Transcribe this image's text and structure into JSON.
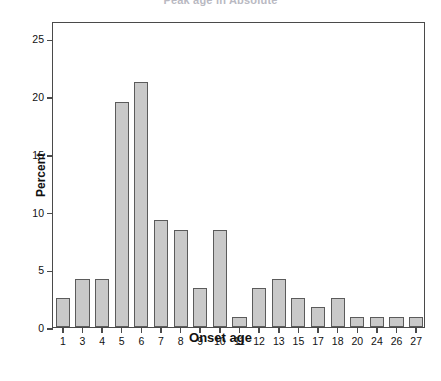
{
  "title_clipped": "Peak age in Absolute",
  "axes": {
    "xlabel": "Onset age",
    "ylabel": "Percent",
    "yticks": [
      0,
      5,
      10,
      15,
      20,
      25
    ],
    "ylim": [
      0,
      26.5
    ],
    "grid": false
  },
  "style": {
    "bar_fill": "#c9c9c9",
    "bar_edge": "#5b5b5b",
    "frame": "#4a4a4a",
    "text": "#111111"
  },
  "chart_data": {
    "type": "bar",
    "title": "Peak age in Absolute",
    "xlabel": "Onset age",
    "ylabel": "Percent",
    "ylim": [
      0,
      26.5
    ],
    "yticks": [
      0,
      5,
      10,
      15,
      20,
      25
    ],
    "grid": false,
    "legend": null,
    "categories": [
      "1",
      "3",
      "4",
      "5",
      "6",
      "7",
      "8",
      "9",
      "10",
      "11",
      "12",
      "13",
      "15",
      "17",
      "18",
      "20",
      "24",
      "26",
      "27"
    ],
    "values": [
      2.5,
      4.2,
      4.2,
      19.5,
      21.2,
      9.3,
      8.4,
      3.4,
      8.4,
      0.85,
      3.4,
      4.2,
      2.5,
      1.7,
      2.5,
      0.85,
      0.85,
      0.85,
      0.85
    ]
  }
}
